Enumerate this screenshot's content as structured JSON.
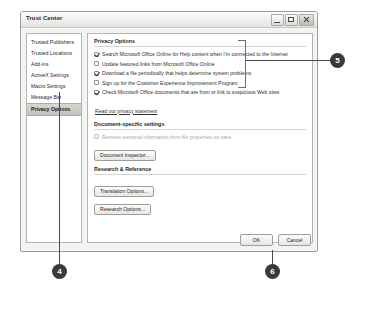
{
  "dialog": {
    "title": "Trust Center",
    "window_controls": [
      {
        "name": "minimize",
        "label": "Minimize"
      },
      {
        "name": "maximize",
        "label": "Maximize"
      },
      {
        "name": "close",
        "label": "Close"
      }
    ]
  },
  "sidebar": {
    "items": [
      {
        "label": "Trusted Publishers",
        "selected": false
      },
      {
        "label": "Trusted Locations",
        "selected": false
      },
      {
        "label": "Add-ins",
        "selected": false
      },
      {
        "label": "ActiveX Settings",
        "selected": false
      },
      {
        "label": "Macro Settings",
        "selected": false
      },
      {
        "label": "Message Bar",
        "selected": false
      },
      {
        "label": "Privacy Options",
        "selected": true
      }
    ]
  },
  "content": {
    "privacy": {
      "heading": "Privacy Options",
      "checkboxes": [
        {
          "label": "Search Microsoft Office Online for Help content when I'm connected to the Internet",
          "checked": true
        },
        {
          "label": "Update featured links from Microsoft Office Online",
          "checked": false
        },
        {
          "label": "Download a file periodically that helps determine system problems",
          "checked": true
        },
        {
          "label": "Sign up for the Customer Experience Improvement Program",
          "checked": false
        },
        {
          "label": "Check Microsoft Office documents that are from or link to suspicious Web sites",
          "checked": true
        }
      ],
      "privacy_link": "Read our privacy statement"
    },
    "document_settings": {
      "heading": "Document-specific settings",
      "checkbox": {
        "label": "Remove personal information from file properties on save",
        "checked": false,
        "disabled": true
      },
      "button": "Document Inspector..."
    },
    "research": {
      "heading": "Research & Reference",
      "buttons": [
        "Translation Options...",
        "Research Options..."
      ]
    }
  },
  "footer": {
    "ok": "OK",
    "cancel": "Cancel"
  },
  "callouts": [
    {
      "number": "5"
    },
    {
      "number": "4"
    },
    {
      "number": "6"
    }
  ]
}
